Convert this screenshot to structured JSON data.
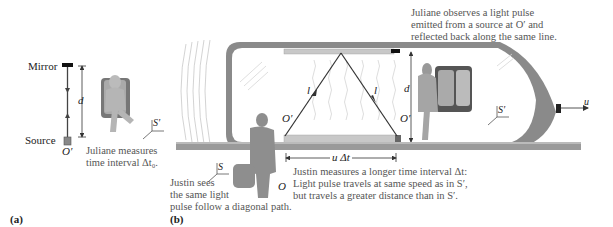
{
  "figure": {
    "panel_a": {
      "label": "(a)",
      "mirror_label": "Mirror",
      "source_label": "Source",
      "origin_label": "O′",
      "distance_label": "d",
      "frame_label": "S′",
      "caption_line1": "Juliane measures",
      "caption_line2": "time interval Δt₀."
    },
    "panel_b": {
      "label": "(b)",
      "top_caption_line1": "Juliane observes a light pulse",
      "top_caption_line2": "emitted from a source at O′ and",
      "top_caption_line3": "reflected back along the same line.",
      "path_label_left": "l",
      "path_label_right": "l",
      "origin_left": "O′",
      "origin_right": "O′",
      "distance_label": "d",
      "velocity_label": "u",
      "train_frame_label": "S′",
      "ground_frame_label": "S",
      "observer_label": "O",
      "displacement_label": "u Δt",
      "justin_caption_line1": "Justin measures a longer time interval Δt:",
      "justin_caption_line2": "Light pulse travels at same speed as in S′,",
      "justin_caption_line3": "but travels a greater distance than in S′.",
      "justin_sees_line1": "Justin sees",
      "justin_sees_line2": "the same light",
      "justin_sees_line3": "pulse follow a diagonal path."
    },
    "colors": {
      "train_body": "#8a8a8a",
      "rail": "#9a9a9a",
      "figure_fill": "#9e9e9e",
      "caption_text": "#555555",
      "line": "#333333"
    }
  }
}
